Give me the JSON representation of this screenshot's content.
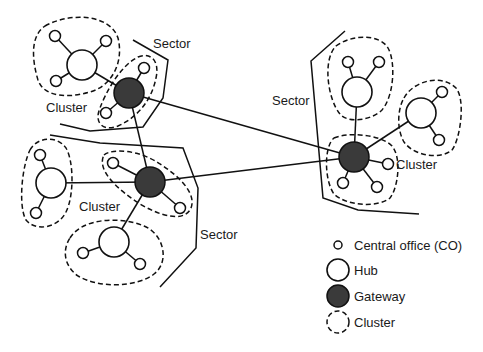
{
  "diagram": {
    "title": "",
    "labels": {
      "sector_top_left": "Sector",
      "sector_right": "Sector",
      "sector_bottom": "Sector",
      "cluster_top_left": "Cluster",
      "cluster_bottom_left": "Cluster",
      "cluster_right": "Cluster"
    },
    "node_types": {
      "co": "Central office (CO)",
      "hub": "Hub",
      "gateway": "Gateway",
      "cluster": "Cluster"
    },
    "colors": {
      "gateway_fill": "#3a3a3a",
      "stroke": "#111111",
      "background": "#ffffff"
    },
    "gateways": [
      {
        "id": "G1",
        "x": 129,
        "y": 93
      },
      {
        "id": "G2",
        "x": 150,
        "y": 182
      },
      {
        "id": "G3",
        "x": 354,
        "y": 157
      }
    ],
    "hubs": [
      {
        "id": "H1",
        "x": 82,
        "y": 65,
        "gateway": "G1"
      },
      {
        "id": "H2",
        "x": 51,
        "y": 183,
        "gateway": "G2"
      },
      {
        "id": "H3",
        "x": 114,
        "y": 242,
        "gateway": "G2"
      },
      {
        "id": "H4",
        "x": 357,
        "y": 92,
        "gateway": "G3"
      },
      {
        "id": "H5",
        "x": 421,
        "y": 113,
        "gateway": "G3"
      }
    ],
    "central_offices": [
      {
        "x": 55,
        "y": 36,
        "parent": "H1"
      },
      {
        "x": 106,
        "y": 41,
        "parent": "H1"
      },
      {
        "x": 56,
        "y": 81,
        "parent": "H1"
      },
      {
        "x": 144,
        "y": 68,
        "parent": "G1"
      },
      {
        "x": 106,
        "y": 113,
        "parent": "G1"
      },
      {
        "x": 40,
        "y": 155,
        "parent": "H2"
      },
      {
        "x": 36,
        "y": 213,
        "parent": "H2"
      },
      {
        "x": 113,
        "y": 163,
        "parent": "G2"
      },
      {
        "x": 180,
        "y": 208,
        "parent": "G2"
      },
      {
        "x": 83,
        "y": 253,
        "parent": "H3"
      },
      {
        "x": 140,
        "y": 264,
        "parent": "H3"
      },
      {
        "x": 348,
        "y": 62,
        "parent": "H4"
      },
      {
        "x": 379,
        "y": 62,
        "parent": "H4"
      },
      {
        "x": 442,
        "y": 92,
        "parent": "H5"
      },
      {
        "x": 439,
        "y": 140,
        "parent": "H5"
      },
      {
        "x": 388,
        "y": 164,
        "parent": "G3"
      },
      {
        "x": 343,
        "y": 183,
        "parent": "G3"
      },
      {
        "x": 377,
        "y": 187,
        "parent": "G3"
      }
    ],
    "gateway_links": [
      {
        "from": "G1",
        "to": "G2"
      },
      {
        "from": "G1",
        "to": "G3"
      },
      {
        "from": "G2",
        "to": "G3"
      }
    ],
    "legend": [
      {
        "type": "co",
        "label": "Central office (CO)"
      },
      {
        "type": "hub",
        "label": "Hub"
      },
      {
        "type": "gateway",
        "label": "Gateway"
      },
      {
        "type": "cluster",
        "label": "Cluster"
      }
    ]
  }
}
